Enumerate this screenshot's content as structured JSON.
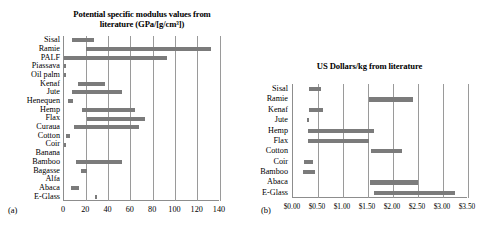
{
  "figure": {
    "panel_a_letter": "(a)",
    "panel_b_letter": "(b)"
  },
  "chart_data": [
    {
      "id": "panel-a",
      "type": "bar",
      "orientation": "horizontal-range",
      "title": "Potential specific modulus values from literature (GPa/[g/cm³])",
      "title_line1": "Potential specific modulus values from",
      "title_line2": "literature (GPa/[g/cm³])",
      "xlabel": "",
      "ylabel": "",
      "xlim": [
        0,
        140
      ],
      "xticks": [
        0,
        20,
        40,
        60,
        80,
        100,
        120,
        140
      ],
      "xticklabels": [
        "0",
        "20",
        "40",
        "60",
        "80",
        "100",
        "120",
        "140"
      ],
      "grid": true,
      "legend": "none",
      "bar_color": "#7b7b7b",
      "categories": [
        "Sisal",
        "Ramie",
        "PALF",
        "Piassava",
        "Oil palm",
        "Kenaf",
        "Jute",
        "Henequen",
        "Hemp",
        "Flax",
        "Curaua",
        "Cotton",
        "Coir",
        "Banana",
        "Bamboo",
        "Bagasse",
        "Alfa",
        "Abaca",
        "E-Glass"
      ],
      "ranges": [
        {
          "category": "Sisal",
          "low": 7.0,
          "high": 27.0
        },
        {
          "category": "Ramie",
          "low": 20.0,
          "high": 132.0
        },
        {
          "category": "PALF",
          "low": 0.0,
          "high": 92.0
        },
        {
          "category": "Piassava",
          "low": 0.0,
          "high": 1.5
        },
        {
          "category": "Oil palm",
          "low": 0.0,
          "high": 2.0
        },
        {
          "category": "Kenaf",
          "low": 13.0,
          "high": 37.0
        },
        {
          "category": "Jute",
          "low": 7.0,
          "high": 52.0
        },
        {
          "category": "Henequen",
          "low": 4.0,
          "high": 8.0
        },
        {
          "category": "Hemp",
          "low": 16.0,
          "high": 63.5
        },
        {
          "category": "Flax",
          "low": 20.5,
          "high": 72.5
        },
        {
          "category": "Curaua",
          "low": 9.0,
          "high": 67.5
        },
        {
          "category": "Cotton",
          "low": 1.5,
          "high": 5.5
        },
        {
          "category": "Coir",
          "low": 0.0,
          "high": 2.0
        },
        {
          "category": "Banana",
          "low": null,
          "high": null
        },
        {
          "category": "Bamboo",
          "low": 11.0,
          "high": 52.5
        },
        {
          "category": "Bagasse",
          "low": 15.0,
          "high": 21.0
        },
        {
          "category": "Alfa",
          "low": null,
          "high": null
        },
        {
          "category": "Abaca",
          "low": 6.5,
          "high": 13.5
        },
        {
          "category": "E-Glass",
          "low": 28.0,
          "high": 30.0
        }
      ]
    },
    {
      "id": "panel-b",
      "type": "bar",
      "orientation": "horizontal-range",
      "title": "US Dollars/kg from literature",
      "xlabel": "",
      "ylabel": "",
      "xlim": [
        0.0,
        3.5
      ],
      "xticks": [
        0.0,
        0.5,
        1.0,
        1.5,
        2.0,
        2.5,
        3.0,
        3.5
      ],
      "xticklabels": [
        "$0.00",
        "$0.50",
        "$1.00",
        "$1.50",
        "$2.00",
        "$2.50",
        "$3.00",
        "$3.50"
      ],
      "grid": true,
      "legend": "none",
      "bar_color": "#7b7b7b",
      "categories": [
        "Sisal",
        "Ramie",
        "Kenaf",
        "Jute",
        "Hemp",
        "Flax",
        "Cotton",
        "Coir",
        "Bamboo",
        "Abaca",
        "E-Glass"
      ],
      "ranges": [
        {
          "category": "Sisal",
          "low": 0.32,
          "high": 0.56
        },
        {
          "category": "Ramie",
          "low": 1.52,
          "high": 2.4
        },
        {
          "category": "Kenaf",
          "low": 0.32,
          "high": 0.6
        },
        {
          "category": "Jute",
          "low": 0.28,
          "high": 0.32
        },
        {
          "category": "Hemp",
          "low": 0.3,
          "high": 1.62
        },
        {
          "category": "Flax",
          "low": 0.3,
          "high": 1.52
        },
        {
          "category": "Cotton",
          "low": 1.56,
          "high": 2.18
        },
        {
          "category": "Coir",
          "low": 0.22,
          "high": 0.4
        },
        {
          "category": "Bamboo",
          "low": 0.2,
          "high": 0.44
        },
        {
          "category": "Abaca",
          "low": 1.54,
          "high": 2.5
        },
        {
          "category": "E-Glass",
          "low": 1.62,
          "high": 3.24
        }
      ]
    }
  ]
}
